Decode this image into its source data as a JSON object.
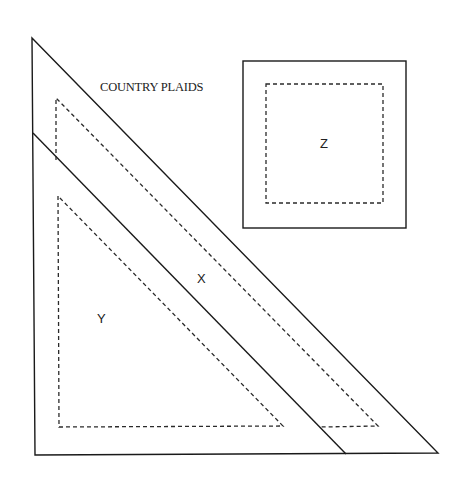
{
  "title": "COUNTRY PLAIDS",
  "pieces": {
    "x": {
      "label": "X",
      "shape": "trapezoid-band"
    },
    "y": {
      "label": "Y",
      "shape": "right-triangle"
    },
    "z": {
      "label": "Z",
      "shape": "square"
    }
  },
  "legend": {
    "cut_line": "solid",
    "seam_line": "dashed"
  },
  "colors": {
    "line": "#1a1a1a",
    "background": "#ffffff"
  }
}
